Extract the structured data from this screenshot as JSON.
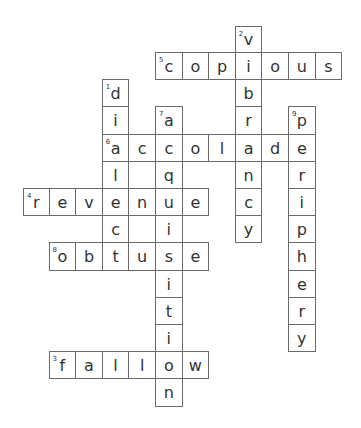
{
  "puzzle": {
    "grid": {
      "left": 23,
      "top": 25.8,
      "cell_w": 26.6,
      "cell_h": 27.2
    },
    "words": [
      {
        "number": 1,
        "direction": "down",
        "answer": "dialect",
        "col": 3,
        "row": 2
      },
      {
        "number": 2,
        "direction": "down",
        "answer": "vibrancy",
        "col": 8,
        "row": 0
      },
      {
        "number": 3,
        "direction": "across",
        "answer": "fallow",
        "col": 1,
        "row": 12
      },
      {
        "number": 4,
        "direction": "across",
        "answer": "revenue",
        "col": 0,
        "row": 6
      },
      {
        "number": 5,
        "direction": "across",
        "answer": "copious",
        "col": 5,
        "row": 1
      },
      {
        "number": 6,
        "direction": "across",
        "answer": "accolade",
        "col": 3,
        "row": 4
      },
      {
        "number": 7,
        "direction": "down",
        "answer": "acquisition",
        "col": 5,
        "row": 3
      },
      {
        "number": 8,
        "direction": "across",
        "answer": "obtuse",
        "col": 1,
        "row": 8
      },
      {
        "number": 9,
        "direction": "down",
        "answer": "periphery",
        "col": 10,
        "row": 3
      }
    ]
  },
  "colors": {
    "border": "#6a6a6a",
    "text": "#333333",
    "background": "#ffffff"
  }
}
